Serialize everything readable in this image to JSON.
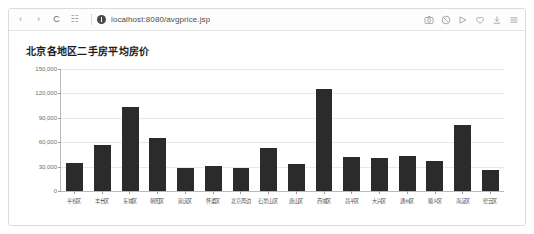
{
  "browser": {
    "nav": {
      "back_label": "‹",
      "forward_label": "›",
      "reload_label": "C",
      "apps_label": "☷"
    },
    "address": {
      "url": "localhost:8080/avgprice.jsp",
      "security_icon": "info-circle-icon"
    },
    "tool_icons": [
      {
        "name": "screenshot-icon",
        "label": "screenshot"
      },
      {
        "name": "adblock-icon",
        "label": "adblock"
      },
      {
        "name": "translate-icon",
        "label": "translate"
      },
      {
        "name": "favorite-heart-icon",
        "label": "favorite"
      },
      {
        "name": "download-icon",
        "label": "download"
      },
      {
        "name": "menu-icon",
        "label": "menu"
      }
    ]
  },
  "chart_data": {
    "type": "bar",
    "title": "北京各地区二手房平均房价",
    "xlabel": "",
    "ylabel": "",
    "ylim": [
      0,
      150000
    ],
    "grid": true,
    "legend": "none",
    "bar_color": "#2b2b2b",
    "ytick_labels": [
      "0",
      "30,000",
      "60,000",
      "90,000",
      "120,000",
      "150,000"
    ],
    "ytick_values": [
      0,
      30000,
      60000,
      90000,
      120000,
      150000
    ],
    "categories": [
      "平谷区",
      "丰台区",
      "东城区",
      "朝阳区",
      "延庆区",
      "怀柔区",
      "北京周边",
      "石景山区",
      "唐山区",
      "西城区",
      "昌平区",
      "大兴区",
      "通州区",
      "顺义区",
      "海淀区",
      "密云区"
    ],
    "values": [
      35000,
      56000,
      103000,
      65000,
      28000,
      31000,
      28000,
      53000,
      33000,
      125000,
      42000,
      41000,
      43000,
      37000,
      81000,
      26000
    ]
  }
}
